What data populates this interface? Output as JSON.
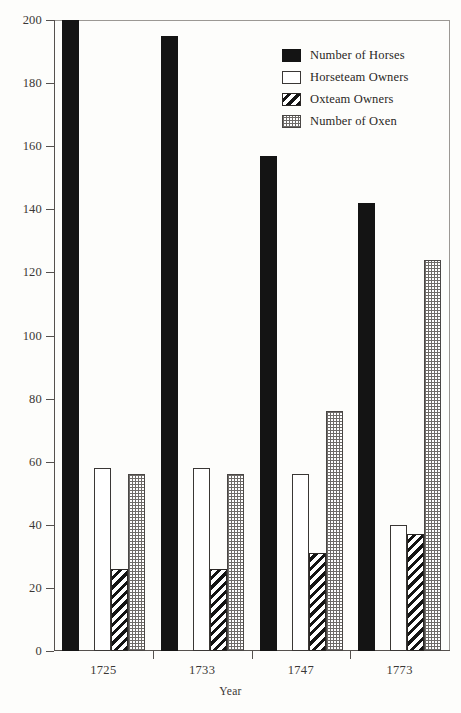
{
  "chart_data": {
    "type": "bar",
    "title": "",
    "xlabel": "Year",
    "ylabel": "",
    "categories": [
      "1725",
      "1733",
      "1747",
      "1773"
    ],
    "ylim": [
      0,
      200
    ],
    "yticks": [
      0,
      20,
      40,
      60,
      80,
      100,
      120,
      140,
      160,
      180,
      200
    ],
    "ytick_labels": [
      "0",
      "20",
      "40",
      "60",
      "80",
      "100",
      "120",
      "140",
      "160",
      "180",
      "200"
    ],
    "grid": false,
    "legend_position": "top-right",
    "series": [
      {
        "name": "Number of Horses",
        "pattern": "solid-black",
        "color": "#141414",
        "values": [
          200,
          195,
          157,
          142
        ]
      },
      {
        "name": "Horseteam Owners",
        "pattern": "open-white",
        "color": "#ffffff",
        "values": [
          58,
          58,
          56,
          40
        ]
      },
      {
        "name": "Oxteam Owners",
        "pattern": "diagonal-hatch",
        "color": "#141414",
        "values": [
          26,
          26,
          31,
          37
        ]
      },
      {
        "name": "Number of Oxen",
        "pattern": "dotted-grid",
        "color": "#6e6b68",
        "values": [
          56,
          56,
          76,
          124
        ]
      }
    ]
  },
  "axis": {
    "x_title": "Year"
  },
  "legend": {
    "items": [
      {
        "label": "Number of Horses"
      },
      {
        "label": "Horseteam Owners"
      },
      {
        "label": "Oxteam Owners"
      },
      {
        "label": "Number of Oxen"
      }
    ]
  }
}
